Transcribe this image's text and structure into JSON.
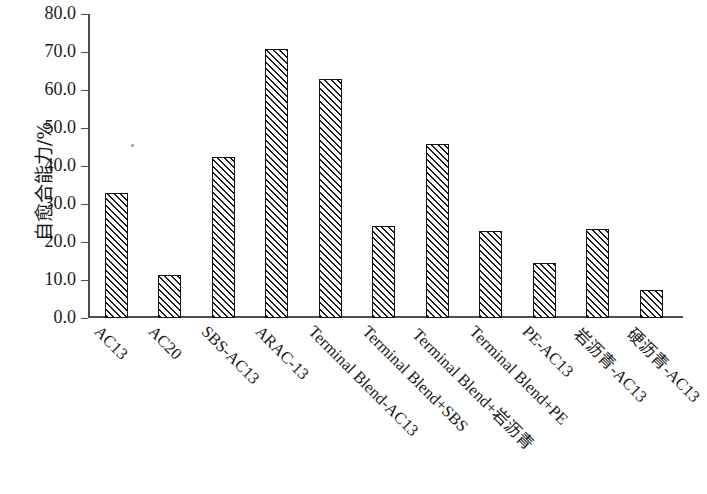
{
  "chart_data": {
    "type": "bar",
    "title": "",
    "xlabel": "",
    "ylabel": "自愈合能力/%",
    "ylim": [
      0.0,
      80.0
    ],
    "ytick_step": 10.0,
    "ytick_labels": [
      "80.0",
      "70.0",
      "60.0",
      "50.0",
      "40.0",
      "30.0",
      "20.0",
      "10.0",
      "0.0"
    ],
    "ytick_values": [
      80.0,
      70.0,
      60.0,
      50.0,
      40.0,
      30.0,
      20.0,
      10.0,
      0.0
    ],
    "grid": false,
    "legend": false,
    "bar_style": {
      "fill": "#ffffff",
      "hatch": "diagonal-45",
      "hatch_color": "#1c1c1c",
      "edge_color": "#111111"
    },
    "categories": [
      "AC13",
      "AC20",
      "SBS-AC13",
      "ARAC-13",
      "Terminal Blend-AC13",
      "Terminal Blend+SBS",
      "Terminal Blend+岩沥青",
      "Terminal Blend+PE",
      "PE-AC13",
      "岩沥青-AC13",
      "硬沥青-AC13"
    ],
    "values": [
      32.8,
      11.4,
      42.5,
      70.7,
      62.9,
      24.1,
      45.7,
      22.9,
      14.4,
      23.3,
      7.3
    ]
  }
}
